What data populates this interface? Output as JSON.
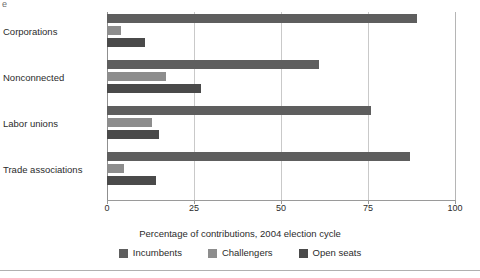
{
  "figure": {
    "scan_artifact_text": "e",
    "axis_title": "Percentage of contributions, 2004 election cycle"
  },
  "legend": {
    "items": [
      {
        "label": "Incumbents",
        "color": "#5e5e5e"
      },
      {
        "label": "Challengers",
        "color": "#8d8d8d"
      },
      {
        "label": "Open seats",
        "color": "#4a4a4a"
      }
    ]
  },
  "chart_data": {
    "type": "bar",
    "orientation": "horizontal",
    "title": "",
    "xlabel": "Percentage of contributions, 2004 election cycle",
    "ylabel": "",
    "xlim": [
      0,
      100
    ],
    "xticks": [
      0,
      25,
      50,
      75,
      100
    ],
    "xtick_labels": [
      "0",
      "25",
      "50",
      "75",
      "100"
    ],
    "grid": true,
    "grid_axis": "x",
    "legend_position": "bottom",
    "categories": [
      "Corporations",
      "Nonconnected",
      "Labor unions",
      "Trade associations"
    ],
    "series": [
      {
        "name": "Incumbents",
        "color": "#5e5e5e",
        "values": [
          89,
          61,
          76,
          87
        ]
      },
      {
        "name": "Challengers",
        "color": "#8d8d8d",
        "values": [
          4,
          17,
          13,
          5
        ]
      },
      {
        "name": "Open seats",
        "color": "#4a4a4a",
        "values": [
          11,
          27,
          15,
          14
        ]
      }
    ]
  }
}
